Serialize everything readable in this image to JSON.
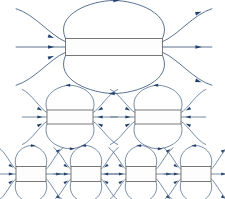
{
  "figure": {
    "canvas": {
      "width": 225,
      "height": 199,
      "background": "#ffffff"
    },
    "colors": {
      "field_line": "#3d5a80",
      "arrow_head": "#22406b",
      "magnet_outline": "#6a6a6a",
      "magnet_fill": "#fdfdfd",
      "background": "#ffffff"
    },
    "rows": [
      {
        "name": "large-row",
        "scale_label": "large",
        "count": 1,
        "items": [
          {
            "name": "dipole-large-1",
            "cx": 114,
            "cy": 47,
            "magnet_width": 97,
            "magnet_height": 17,
            "loop_rx": 52,
            "loop_ry": 20,
            "top_arrow_direction": "right",
            "bottom_arrow_direction": "left",
            "side_flux_lines": 3,
            "left_arrow_direction": "inward",
            "right_arrow_direction": "outward"
          }
        ]
      },
      {
        "name": "medium-row",
        "scale_label": "medium",
        "count": 2,
        "items": [
          {
            "name": "dipole-medium-1",
            "cx": 70,
            "cy": 117,
            "magnet_width": 46,
            "magnet_height": 14,
            "loop_rx": 26,
            "loop_ry": 13,
            "top_arrow_direction": "left",
            "bottom_arrow_direction": "right",
            "side_flux_lines": 3,
            "left_arrow_direction": "inward",
            "right_arrow_direction": "inward"
          },
          {
            "name": "dipole-medium-2",
            "cx": 158,
            "cy": 117,
            "magnet_width": 46,
            "magnet_height": 14,
            "loop_rx": 26,
            "loop_ry": 13,
            "top_arrow_direction": "left",
            "bottom_arrow_direction": "right",
            "side_flux_lines": 3,
            "left_arrow_direction": "inward",
            "right_arrow_direction": "inward"
          }
        ]
      },
      {
        "name": "small-row",
        "scale_label": "small",
        "count": 4,
        "items": [
          {
            "name": "dipole-small-1",
            "cx": 31,
            "cy": 174,
            "magnet_width": 30,
            "magnet_height": 15,
            "loop_rx": 18,
            "loop_ry": 11,
            "top_arrow_direction": "right",
            "bottom_arrow_direction": "left",
            "side_flux_lines": 3,
            "left_arrow_direction": "inward",
            "right_arrow_direction": "outward"
          },
          {
            "name": "dipole-small-2",
            "cx": 86,
            "cy": 174,
            "magnet_width": 30,
            "magnet_height": 15,
            "loop_rx": 18,
            "loop_ry": 11,
            "top_arrow_direction": "left",
            "bottom_arrow_direction": "right",
            "side_flux_lines": 3,
            "left_arrow_direction": "inward",
            "right_arrow_direction": "inward"
          },
          {
            "name": "dipole-small-3",
            "cx": 141,
            "cy": 174,
            "magnet_width": 30,
            "magnet_height": 15,
            "loop_rx": 18,
            "loop_ry": 11,
            "top_arrow_direction": "left",
            "bottom_arrow_direction": "right",
            "side_flux_lines": 3,
            "left_arrow_direction": "inward",
            "right_arrow_direction": "outward"
          },
          {
            "name": "dipole-small-4",
            "cx": 196,
            "cy": 174,
            "magnet_width": 30,
            "magnet_height": 15,
            "loop_rx": 18,
            "loop_ry": 11,
            "top_arrow_direction": "left",
            "bottom_arrow_direction": "right",
            "side_flux_lines": 3,
            "left_arrow_direction": "inward",
            "right_arrow_direction": "outward"
          }
        ]
      }
    ]
  }
}
